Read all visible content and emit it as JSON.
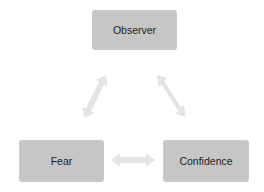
{
  "diagram": {
    "type": "cycle-triangle",
    "nodes": [
      {
        "id": "observer",
        "label": "Observer"
      },
      {
        "id": "fear",
        "label": "Fear"
      },
      {
        "id": "confidence",
        "label": "Confidence"
      }
    ],
    "edges": [
      {
        "from": "observer",
        "to": "fear",
        "style": "double-arrow"
      },
      {
        "from": "observer",
        "to": "confidence",
        "style": "double-arrow"
      },
      {
        "from": "fear",
        "to": "confidence",
        "style": "double-arrow"
      }
    ],
    "colors": {
      "node_fill": "#c6c6c6",
      "node_text": "#1e1e1e",
      "arrow_fill": "#e4e4e4",
      "background": "#ffffff"
    }
  }
}
